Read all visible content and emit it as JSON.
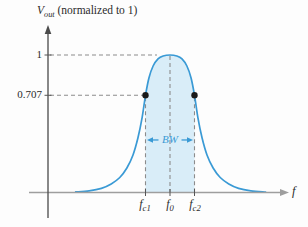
{
  "figure": {
    "y_axis_title": {
      "variable": "V",
      "subscript": "out",
      "suffix": " (normalized to 1)"
    },
    "x_axis_end_label": "f",
    "y_tick_labels": {
      "one": "1",
      "cutoff": "0.707"
    },
    "x_tick_labels": {
      "fc1": {
        "variable": "f",
        "subscript": "c1"
      },
      "f0": {
        "variable": "f",
        "subscript": "0"
      },
      "fc2": {
        "variable": "f",
        "subscript": "c2"
      }
    },
    "bandwidth_label": "BW"
  },
  "colors": {
    "curve": "#3a9ad5",
    "region_fill": "#d9edf8",
    "dashed": "#8c8c8c",
    "x_axis": "#9e9e9e",
    "y_axis": "#4a4a4a",
    "dot": "#1a1a1a",
    "text": "#2b2b2b"
  },
  "chart_data": {
    "type": "line",
    "xlabel": "f",
    "ylabel": "V_out (normalized to 1)",
    "x_unit": "frequency offset from f0 in units of half-bandwidth (BW/2)",
    "ylim": [
      0,
      1
    ],
    "y_ticks": [
      1,
      0.707
    ],
    "x_ticks": [
      "f_c1",
      "f_0",
      "f_c2"
    ],
    "key_points": [
      {
        "label": "f_c1",
        "x": -1,
        "v": 0.707
      },
      {
        "label": "f_0",
        "x": 0,
        "v": 1
      },
      {
        "label": "f_c2",
        "x": 1,
        "v": 0.707
      }
    ],
    "curve_points": [
      [
        -3.85,
        0.004
      ],
      [
        -3.3,
        0.012
      ],
      [
        -2.8,
        0.03
      ],
      [
        -2.4,
        0.062
      ],
      [
        -2.05,
        0.109
      ],
      [
        -1.76,
        0.178
      ],
      [
        -1.51,
        0.273
      ],
      [
        -1.31,
        0.396
      ],
      [
        -1.14,
        0.542
      ],
      [
        -1,
        0.707
      ],
      [
        -0.86,
        0.833
      ],
      [
        -0.69,
        0.92
      ],
      [
        -0.49,
        0.972
      ],
      [
        -0.28,
        0.993
      ],
      [
        0,
        1
      ],
      [
        0.28,
        0.993
      ],
      [
        0.49,
        0.972
      ],
      [
        0.69,
        0.92
      ],
      [
        0.86,
        0.833
      ],
      [
        1,
        0.707
      ],
      [
        1.14,
        0.542
      ],
      [
        1.31,
        0.396
      ],
      [
        1.51,
        0.273
      ],
      [
        1.76,
        0.178
      ],
      [
        2.05,
        0.109
      ],
      [
        2.4,
        0.062
      ],
      [
        2.8,
        0.03
      ],
      [
        3.3,
        0.012
      ],
      [
        3.9,
        0.003
      ]
    ],
    "shaded_region": {
      "from": "f_c1",
      "to": "f_c2",
      "fills_under_curve": true
    },
    "annotations": [
      {
        "label": "BW",
        "from": "f_c1",
        "to": "f_c2",
        "at_v": 0.382
      },
      {
        "label": "dashed guide",
        "v": 1,
        "to_x": "f_0"
      },
      {
        "label": "dashed guide",
        "v": 0.707,
        "to_x": "f_c1"
      }
    ]
  }
}
